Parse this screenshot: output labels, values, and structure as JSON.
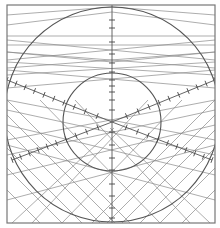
{
  "diagram": {
    "title": "",
    "width": 220,
    "height": 228,
    "colors": {
      "background": "#ffffff",
      "line": "#8a8a8a",
      "axis": "#555555",
      "tick": "#444444"
    },
    "frame": {
      "x": 7,
      "y": 5,
      "w": 208,
      "h": 218
    },
    "center": {
      "x": 112,
      "y": 122
    },
    "circles": [
      {
        "name": "outer-circle",
        "cx": 112,
        "cy": 114.5,
        "r": 107.5
      },
      {
        "name": "inner-circle",
        "cx": 112,
        "cy": 122,
        "r": 49
      }
    ],
    "axes": [
      {
        "name": "vertical-axis",
        "x1": 112,
        "y1": 5,
        "x2": 112,
        "y2": 223
      },
      {
        "name": "axis-upper-left",
        "x1": 112,
        "y1": 122,
        "x2": 7,
        "y2": 80
      },
      {
        "name": "axis-upper-right",
        "x1": 112,
        "y1": 122,
        "x2": 215,
        "y2": 80
      },
      {
        "name": "axis-lower-left",
        "x1": 112,
        "y1": 122,
        "x2": 12,
        "y2": 160
      },
      {
        "name": "axis-lower-right",
        "x1": 112,
        "y1": 122,
        "x2": 212,
        "y2": 160
      }
    ],
    "ticks_per_axis": 10,
    "vertical_ticks_y": [
      20,
      28,
      42,
      54,
      63,
      72,
      80,
      86,
      92,
      100,
      110,
      132,
      145,
      158,
      170,
      184,
      196,
      208,
      218
    ],
    "upper_fan_lines": [
      {
        "x1": 7,
        "y1": 15,
        "x2": 112,
        "y2": 7
      },
      {
        "x1": 7,
        "y1": 25,
        "x2": 112,
        "y2": 12
      },
      {
        "x1": 7,
        "y1": 36,
        "x2": 215,
        "y2": 36
      },
      {
        "x1": 7,
        "y1": 45,
        "x2": 215,
        "y2": 45
      },
      {
        "x1": 7,
        "y1": 52,
        "x2": 112,
        "y2": 62
      },
      {
        "x1": 7,
        "y1": 60,
        "x2": 215,
        "y2": 40
      },
      {
        "x1": 7,
        "y1": 68,
        "x2": 215,
        "y2": 52
      },
      {
        "x1": 7,
        "y1": 75,
        "x2": 215,
        "y2": 62
      },
      {
        "x1": 215,
        "y1": 15,
        "x2": 112,
        "y2": 7
      },
      {
        "x1": 215,
        "y1": 25,
        "x2": 112,
        "y2": 12
      },
      {
        "x1": 215,
        "y1": 52,
        "x2": 112,
        "y2": 62
      },
      {
        "x1": 215,
        "y1": 60,
        "x2": 7,
        "y2": 40
      },
      {
        "x1": 215,
        "y1": 68,
        "x2": 7,
        "y2": 52
      },
      {
        "x1": 215,
        "y1": 75,
        "x2": 7,
        "y2": 62
      },
      {
        "x1": 7,
        "y1": 88,
        "x2": 215,
        "y2": 70
      },
      {
        "x1": 215,
        "y1": 88,
        "x2": 7,
        "y2": 70
      }
    ],
    "lower_grid_lines": [
      {
        "x1": 7,
        "y1": 100,
        "x2": 130,
        "y2": 223
      },
      {
        "x1": 7,
        "y1": 115,
        "x2": 115,
        "y2": 223
      },
      {
        "x1": 7,
        "y1": 130,
        "x2": 100,
        "y2": 223
      },
      {
        "x1": 7,
        "y1": 148,
        "x2": 82,
        "y2": 223
      },
      {
        "x1": 7,
        "y1": 168,
        "x2": 62,
        "y2": 223
      },
      {
        "x1": 7,
        "y1": 190,
        "x2": 40,
        "y2": 223
      },
      {
        "x1": 40,
        "y1": 100,
        "x2": 160,
        "y2": 223
      },
      {
        "x1": 75,
        "y1": 100,
        "x2": 190,
        "y2": 223
      },
      {
        "x1": 110,
        "y1": 128,
        "x2": 210,
        "y2": 223
      },
      {
        "x1": 215,
        "y1": 100,
        "x2": 92,
        "y2": 223
      },
      {
        "x1": 215,
        "y1": 115,
        "x2": 107,
        "y2": 223
      },
      {
        "x1": 215,
        "y1": 130,
        "x2": 122,
        "y2": 223
      },
      {
        "x1": 215,
        "y1": 148,
        "x2": 140,
        "y2": 223
      },
      {
        "x1": 215,
        "y1": 168,
        "x2": 160,
        "y2": 223
      },
      {
        "x1": 215,
        "y1": 190,
        "x2": 182,
        "y2": 223
      },
      {
        "x1": 182,
        "y1": 100,
        "x2": 62,
        "y2": 223
      },
      {
        "x1": 148,
        "y1": 100,
        "x2": 32,
        "y2": 223
      },
      {
        "x1": 114,
        "y1": 128,
        "x2": 12,
        "y2": 223
      },
      {
        "x1": 7,
        "y1": 140,
        "x2": 215,
        "y2": 100
      },
      {
        "x1": 7,
        "y1": 155,
        "x2": 215,
        "y2": 110
      },
      {
        "x1": 7,
        "y1": 175,
        "x2": 215,
        "y2": 125
      },
      {
        "x1": 7,
        "y1": 200,
        "x2": 215,
        "y2": 145
      },
      {
        "x1": 215,
        "y1": 140,
        "x2": 7,
        "y2": 100
      },
      {
        "x1": 215,
        "y1": 155,
        "x2": 7,
        "y2": 110
      },
      {
        "x1": 215,
        "y1": 175,
        "x2": 7,
        "y2": 125
      },
      {
        "x1": 215,
        "y1": 200,
        "x2": 7,
        "y2": 145
      }
    ]
  }
}
